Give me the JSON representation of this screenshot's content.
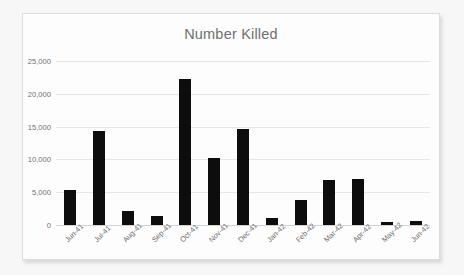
{
  "chart_data": {
    "type": "bar",
    "title": "Number Killed",
    "xlabel": "",
    "ylabel": "",
    "categories": [
      "Jun-41",
      "Jul-41",
      "Aug-41",
      "Sep-41",
      "Oct-41",
      "Nov-41",
      "Dec-41",
      "Jan-42",
      "Feb-42",
      "Mar-42",
      "Apr-42",
      "May-42",
      "Jun-42"
    ],
    "values": [
      5300,
      14400,
      2200,
      1450,
      22300,
      10200,
      14700,
      1100,
      3800,
      6900,
      7000,
      500,
      600
    ],
    "ylim": [
      0,
      25000
    ],
    "yticks": [
      0,
      5000,
      10000,
      15000,
      20000,
      25000
    ],
    "ytick_labels": [
      "0",
      "5,000",
      "10,000",
      "15,000",
      "20,000",
      "25,000"
    ],
    "grid": true,
    "legend": "none",
    "series_color": "#0d0d0d"
  },
  "panel": {
    "background": "#fdfdfd",
    "border_color": "#dcdcdc"
  }
}
